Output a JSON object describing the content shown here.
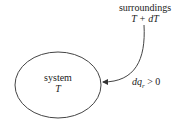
{
  "diagram": {
    "system": {
      "label": "system",
      "temperature": "T"
    },
    "surroundings": {
      "label": "surroundings",
      "temperature": "T + dT"
    },
    "heat_flow": {
      "label": "dq",
      "subscript": "r",
      "relation": " > 0"
    }
  }
}
